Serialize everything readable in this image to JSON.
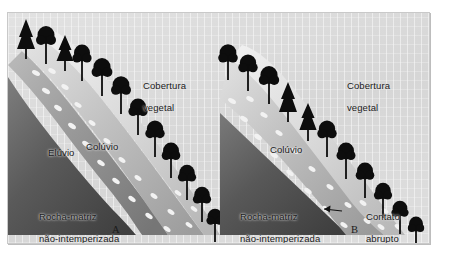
{
  "figure": {
    "background_color": "#dcdcdc",
    "frame_color": "#c9c9c9",
    "soil_dark": "#4a4a4a",
    "soil_mid": "#8f8f8f",
    "soil_light": "#d2d2d2",
    "tree_color": "#0d0d0d",
    "text_color": "#1a1a1a"
  },
  "panel_a": {
    "letter": "A",
    "labels": {
      "vegetation_line1": "Cobertura",
      "vegetation_line2": "vegetal",
      "eluvium": "Elúvio",
      "colluvium": "Colúvio",
      "bedrock_line1": "Rocha-matriz",
      "bedrock_line2": "não-intemperizada"
    }
  },
  "panel_b": {
    "letter": "B",
    "labels": {
      "vegetation_line1": "Cobertura",
      "vegetation_line2": "vegetal",
      "colluvium": "Colúvio",
      "bedrock_line1": "Rocha-matriz",
      "bedrock_line2": "não-intemperizada",
      "contact_line1": "Contato",
      "contact_line2": "abrupto"
    }
  }
}
